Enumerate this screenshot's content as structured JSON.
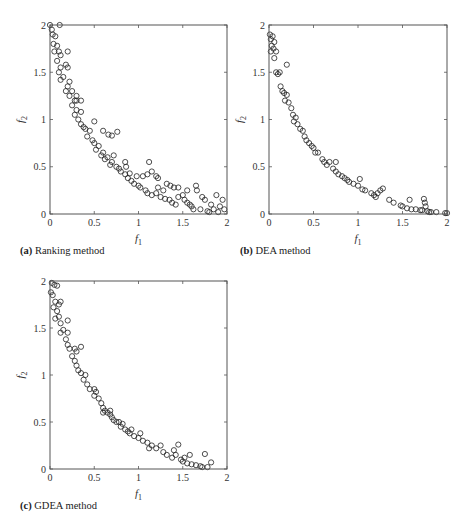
{
  "figure": {
    "panels": [
      {
        "id": "a",
        "caption_label": "(a)",
        "caption_text": "Ranking method"
      },
      {
        "id": "b",
        "caption_label": "(b)",
        "caption_text": "DEA method"
      },
      {
        "id": "c",
        "caption_label": "(c)",
        "caption_text": "GDEA method"
      }
    ]
  },
  "chart_data": [
    {
      "type": "scatter",
      "title": "(a) Ranking method",
      "xlabel": "f1",
      "ylabel": "f2",
      "xlim": [
        0,
        2
      ],
      "ylim": [
        0,
        2
      ],
      "xticks": [
        "0",
        "0.5",
        "1",
        "1.5",
        "2"
      ],
      "yticks": [
        "0",
        "0.5",
        "1",
        "1.5",
        "2"
      ],
      "marker": "open-circle",
      "grid": false,
      "front": "convex Pareto front, f2 ≈ (1 - sqrt(f1/2))^2 * 2 style curve from (0,2) to (2,0)",
      "points": [
        [
          0.0,
          2.0
        ],
        [
          0.11,
          2.0
        ],
        [
          0.02,
          1.95
        ],
        [
          0.03,
          1.9
        ],
        [
          0.06,
          1.88
        ],
        [
          0.04,
          1.8
        ],
        [
          0.08,
          1.78
        ],
        [
          0.1,
          1.72
        ],
        [
          0.2,
          1.72
        ],
        [
          0.05,
          1.72
        ],
        [
          0.12,
          1.68
        ],
        [
          0.08,
          1.62
        ],
        [
          0.18,
          1.58
        ],
        [
          0.12,
          1.55
        ],
        [
          0.2,
          1.55
        ],
        [
          0.1,
          1.5
        ],
        [
          0.15,
          1.45
        ],
        [
          0.12,
          1.42
        ],
        [
          0.22,
          1.4
        ],
        [
          0.2,
          1.35
        ],
        [
          0.18,
          1.3
        ],
        [
          0.25,
          1.3
        ],
        [
          0.22,
          1.25
        ],
        [
          0.28,
          1.2
        ],
        [
          0.3,
          1.2
        ],
        [
          0.25,
          1.15
        ],
        [
          0.3,
          1.1
        ],
        [
          0.35,
          1.08
        ],
        [
          0.28,
          1.05
        ],
        [
          0.32,
          1.0
        ],
        [
          0.35,
          0.95
        ],
        [
          0.38,
          0.92
        ],
        [
          0.5,
          0.98
        ],
        [
          0.4,
          0.9
        ],
        [
          0.45,
          0.88
        ],
        [
          0.6,
          0.88
        ],
        [
          0.66,
          0.84
        ],
        [
          0.7,
          0.83
        ],
        [
          0.76,
          0.87
        ],
        [
          0.42,
          0.82
        ],
        [
          0.48,
          0.78
        ],
        [
          0.5,
          0.75
        ],
        [
          0.55,
          0.72
        ],
        [
          0.52,
          0.68
        ],
        [
          0.6,
          0.65
        ],
        [
          0.58,
          0.62
        ],
        [
          0.65,
          0.6
        ],
        [
          0.62,
          0.58
        ],
        [
          0.7,
          0.55
        ],
        [
          0.68,
          0.52
        ],
        [
          0.75,
          0.5
        ],
        [
          0.78,
          0.48
        ],
        [
          0.85,
          0.55
        ],
        [
          0.86,
          0.5
        ],
        [
          0.8,
          0.45
        ],
        [
          0.85,
          0.42
        ],
        [
          0.88,
          0.38
        ],
        [
          0.92,
          0.35
        ],
        [
          0.95,
          0.32
        ],
        [
          1.0,
          0.3
        ],
        [
          1.02,
          0.28
        ],
        [
          1.05,
          0.4
        ],
        [
          1.1,
          0.42
        ],
        [
          1.12,
          0.55
        ],
        [
          1.15,
          0.45
        ],
        [
          1.2,
          0.4
        ],
        [
          1.22,
          0.38
        ],
        [
          1.08,
          0.25
        ],
        [
          1.1,
          0.22
        ],
        [
          1.15,
          0.2
        ],
        [
          1.2,
          0.22
        ],
        [
          1.25,
          0.18
        ],
        [
          1.3,
          0.16
        ],
        [
          1.35,
          0.15
        ],
        [
          1.38,
          0.12
        ],
        [
          1.32,
          0.32
        ],
        [
          1.36,
          0.3
        ],
        [
          1.4,
          0.28
        ],
        [
          1.45,
          0.28
        ],
        [
          1.42,
          0.1
        ],
        [
          1.5,
          0.2
        ],
        [
          1.52,
          0.15
        ],
        [
          1.55,
          0.12
        ],
        [
          1.58,
          0.1
        ],
        [
          1.6,
          0.08
        ],
        [
          1.62,
          0.05
        ],
        [
          1.65,
          0.3
        ],
        [
          1.66,
          0.25
        ],
        [
          1.7,
          0.05
        ],
        [
          1.72,
          0.18
        ],
        [
          1.75,
          0.15
        ],
        [
          1.78,
          0.03
        ],
        [
          1.8,
          0.02
        ],
        [
          1.82,
          0.1
        ],
        [
          1.85,
          0.05
        ],
        [
          1.88,
          0.2
        ],
        [
          1.9,
          0.02
        ],
        [
          1.92,
          0.08
        ],
        [
          1.95,
          0.15
        ],
        [
          1.97,
          0.05
        ],
        [
          1.22,
          0.28
        ],
        [
          0.98,
          0.4
        ],
        [
          0.9,
          0.43
        ],
        [
          1.28,
          0.25
        ],
        [
          1.45,
          0.18
        ],
        [
          1.55,
          0.25
        ],
        [
          0.72,
          0.62
        ],
        [
          0.35,
          1.2
        ],
        [
          0.3,
          1.25
        ]
      ]
    },
    {
      "type": "scatter",
      "title": "(b) DEA method",
      "xlabel": "f1",
      "ylabel": "f2",
      "xlim": [
        0,
        2
      ],
      "ylim": [
        0,
        2
      ],
      "xticks": [
        "0",
        "0.5",
        "1",
        "1.5",
        "2"
      ],
      "yticks": [
        "0",
        "0.5",
        "1",
        "1.5",
        "2"
      ],
      "marker": "open-circle",
      "grid": false,
      "points": [
        [
          0.01,
          1.9
        ],
        [
          0.02,
          1.85
        ],
        [
          0.04,
          1.88
        ],
        [
          0.06,
          1.82
        ],
        [
          0.03,
          1.78
        ],
        [
          0.05,
          1.75
        ],
        [
          0.02,
          1.72
        ],
        [
          0.08,
          1.72
        ],
        [
          0.06,
          1.65
        ],
        [
          0.2,
          1.58
        ],
        [
          0.08,
          1.5
        ],
        [
          0.1,
          1.48
        ],
        [
          0.12,
          1.5
        ],
        [
          0.13,
          1.35
        ],
        [
          0.15,
          1.3
        ],
        [
          0.17,
          1.28
        ],
        [
          0.2,
          1.26
        ],
        [
          0.18,
          1.2
        ],
        [
          0.22,
          1.18
        ],
        [
          0.25,
          1.12
        ],
        [
          0.27,
          1.05
        ],
        [
          0.3,
          1.02
        ],
        [
          0.28,
          0.98
        ],
        [
          0.32,
          0.95
        ],
        [
          0.35,
          0.9
        ],
        [
          0.38,
          0.88
        ],
        [
          0.4,
          0.82
        ],
        [
          0.42,
          0.78
        ],
        [
          0.45,
          0.75
        ],
        [
          0.48,
          0.72
        ],
        [
          0.5,
          0.7
        ],
        [
          0.52,
          0.65
        ],
        [
          0.55,
          0.65
        ],
        [
          0.6,
          0.58
        ],
        [
          0.62,
          0.55
        ],
        [
          0.65,
          0.52
        ],
        [
          0.68,
          0.55
        ],
        [
          0.72,
          0.48
        ],
        [
          0.75,
          0.45
        ],
        [
          0.75,
          0.55
        ],
        [
          0.78,
          0.42
        ],
        [
          0.82,
          0.4
        ],
        [
          0.85,
          0.38
        ],
        [
          0.88,
          0.36
        ],
        [
          0.9,
          0.34
        ],
        [
          0.95,
          0.32
        ],
        [
          1.0,
          0.3
        ],
        [
          1.02,
          0.37
        ],
        [
          1.05,
          0.26
        ],
        [
          1.08,
          0.25
        ],
        [
          1.15,
          0.22
        ],
        [
          1.18,
          0.2
        ],
        [
          1.2,
          0.18
        ],
        [
          1.22,
          0.22
        ],
        [
          1.25,
          0.25
        ],
        [
          1.28,
          0.27
        ],
        [
          1.35,
          0.15
        ],
        [
          1.4,
          0.12
        ],
        [
          1.48,
          0.09
        ],
        [
          1.5,
          0.08
        ],
        [
          1.55,
          0.06
        ],
        [
          1.58,
          0.15
        ],
        [
          1.6,
          0.05
        ],
        [
          1.65,
          0.05
        ],
        [
          1.7,
          0.04
        ],
        [
          1.72,
          0.04
        ],
        [
          1.74,
          0.16
        ],
        [
          1.75,
          0.12
        ],
        [
          1.76,
          0.08
        ],
        [
          1.78,
          0.03
        ],
        [
          1.8,
          0.02
        ],
        [
          1.82,
          0.02
        ],
        [
          1.88,
          0.02
        ],
        [
          1.98,
          0.01
        ],
        [
          2.0,
          0.01
        ]
      ]
    },
    {
      "type": "scatter",
      "title": "(c) GDEA method",
      "xlabel": "f1",
      "ylabel": "f2",
      "xlim": [
        0,
        2
      ],
      "ylim": [
        0,
        2
      ],
      "xticks": [
        "0",
        "0.5",
        "1",
        "1.5",
        "2"
      ],
      "yticks": [
        "0",
        "0.5",
        "1",
        "1.5",
        "2"
      ],
      "marker": "open-circle",
      "grid": false,
      "points": [
        [
          0.02,
          1.98
        ],
        [
          0.05,
          1.96
        ],
        [
          0.08,
          1.95
        ],
        [
          0.01,
          1.88
        ],
        [
          0.03,
          1.85
        ],
        [
          0.06,
          1.78
        ],
        [
          0.1,
          1.75
        ],
        [
          0.12,
          1.78
        ],
        [
          0.04,
          1.72
        ],
        [
          0.08,
          1.68
        ],
        [
          0.1,
          1.62
        ],
        [
          0.2,
          1.58
        ],
        [
          0.06,
          1.6
        ],
        [
          0.12,
          1.55
        ],
        [
          0.15,
          1.48
        ],
        [
          0.2,
          1.45
        ],
        [
          0.12,
          1.45
        ],
        [
          0.18,
          1.38
        ],
        [
          0.2,
          1.32
        ],
        [
          0.28,
          1.28
        ],
        [
          0.3,
          1.25
        ],
        [
          0.35,
          1.3
        ],
        [
          0.22,
          1.28
        ],
        [
          0.25,
          1.2
        ],
        [
          0.28,
          1.15
        ],
        [
          0.3,
          1.1
        ],
        [
          0.32,
          1.05
        ],
        [
          0.35,
          1.02
        ],
        [
          0.4,
          1.0
        ],
        [
          0.38,
          0.95
        ],
        [
          0.42,
          0.9
        ],
        [
          0.45,
          0.85
        ],
        [
          0.5,
          0.85
        ],
        [
          0.52,
          0.82
        ],
        [
          0.5,
          0.78
        ],
        [
          0.55,
          0.75
        ],
        [
          0.58,
          0.7
        ],
        [
          0.6,
          0.65
        ],
        [
          0.62,
          0.62
        ],
        [
          0.65,
          0.6
        ],
        [
          0.68,
          0.58
        ],
        [
          0.7,
          0.55
        ],
        [
          0.72,
          0.52
        ],
        [
          0.75,
          0.5
        ],
        [
          0.78,
          0.5
        ],
        [
          0.8,
          0.45
        ],
        [
          0.85,
          0.42
        ],
        [
          0.88,
          0.4
        ],
        [
          0.9,
          0.38
        ],
        [
          0.95,
          0.35
        ],
        [
          1.0,
          0.33
        ],
        [
          1.02,
          0.38
        ],
        [
          1.05,
          0.3
        ],
        [
          1.1,
          0.28
        ],
        [
          1.15,
          0.25
        ],
        [
          1.2,
          0.22
        ],
        [
          1.25,
          0.25
        ],
        [
          1.28,
          0.18
        ],
        [
          1.32,
          0.15
        ],
        [
          1.38,
          0.12
        ],
        [
          1.4,
          0.2
        ],
        [
          1.42,
          0.15
        ],
        [
          1.45,
          0.26
        ],
        [
          1.48,
          0.1
        ],
        [
          1.5,
          0.08
        ],
        [
          1.52,
          0.12
        ],
        [
          1.55,
          0.06
        ],
        [
          1.58,
          0.15
        ],
        [
          1.6,
          0.05
        ],
        [
          1.65,
          0.04
        ],
        [
          1.7,
          0.03
        ],
        [
          1.72,
          0.02
        ],
        [
          1.75,
          0.16
        ],
        [
          1.78,
          0.02
        ],
        [
          1.82,
          0.07
        ],
        [
          0.92,
          0.42
        ],
        [
          0.6,
          0.6
        ],
        [
          0.68,
          0.62
        ],
        [
          1.12,
          0.22
        ],
        [
          0.82,
          0.48
        ]
      ]
    }
  ]
}
